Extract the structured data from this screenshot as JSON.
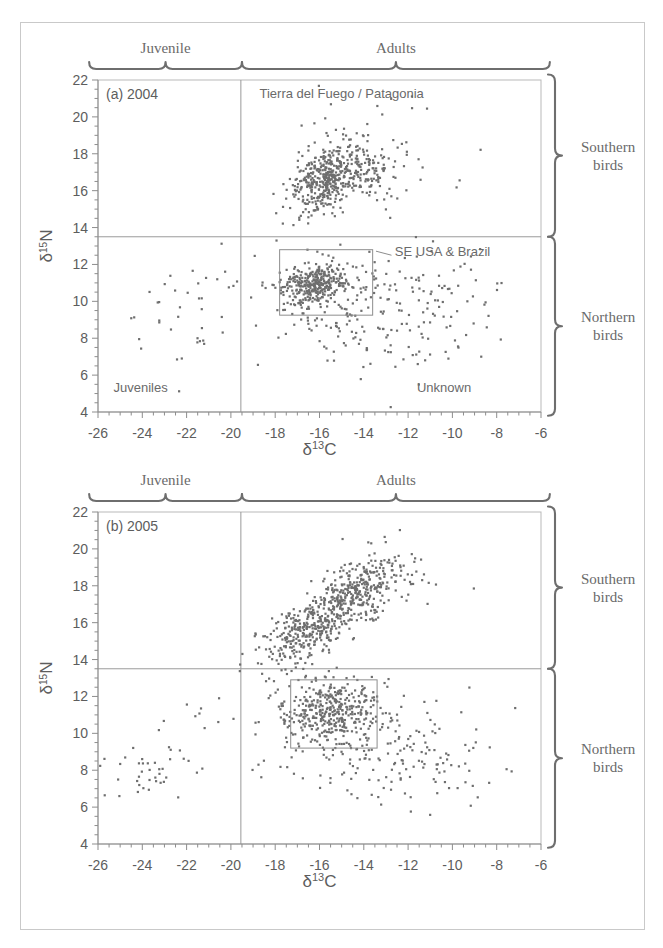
{
  "figure": {
    "outer_border_color": "#c9c9c9",
    "point_color": "#6e6e6e",
    "axis_color": "#8d8d8d"
  },
  "axes": {
    "x": {
      "title_delta": "δ",
      "title_sup": "13",
      "title_elem": "C",
      "ticks": [
        "-26",
        "-24",
        "-22",
        "-20",
        "-18",
        "-16",
        "-14",
        "-12",
        "-10",
        "-8",
        "-6"
      ],
      "tick_values": [
        -26,
        -24,
        -22,
        -20,
        -18,
        -16,
        -14,
        -12,
        -10,
        -8,
        -6
      ],
      "min": -26,
      "max": -6,
      "minor_step": 0.5
    },
    "y": {
      "title_delta": "δ",
      "title_sup": "15",
      "title_elem": "N",
      "ticks": [
        "22",
        "20",
        "18",
        "16",
        "14",
        "12",
        "10",
        "8",
        "6",
        "4"
      ],
      "tick_values": [
        22,
        20,
        18,
        16,
        14,
        12,
        10,
        8,
        6,
        4
      ],
      "min": 4,
      "max": 22,
      "minor_step": 0.5
    }
  },
  "top_braces": [
    {
      "label": "Juvenile",
      "x_from": -26.4,
      "x_to": -19.5
    },
    {
      "label": "Adults",
      "x_from": -19.5,
      "x_to": -5.6
    }
  ],
  "side_braces": [
    {
      "label_line1": "Southern",
      "label_line2": "birds",
      "y_from": 22.3,
      "y_to": 13.5
    },
    {
      "label_line1": "Northern",
      "label_line2": "birds",
      "y_from": 13.5,
      "y_to": 3.8
    }
  ],
  "dividers": {
    "vertical_x": -19.55,
    "horizontal_y": 13.5
  },
  "chart_data": [
    {
      "type": "scatter",
      "panel": "a",
      "title": "(a) 2004",
      "xlabel": "δ13C",
      "ylabel": "δ15N",
      "xlim": [
        -26,
        -6
      ],
      "ylim": [
        4,
        22
      ],
      "grid": false,
      "annotations": [
        {
          "text": "Tierra del Fuego / Patagonia",
          "x": -15.0,
          "y": 21.0,
          "anchor": "middle"
        },
        {
          "text": "SE USA & Brazil",
          "x": -12.6,
          "y": 12.45,
          "anchor": "start"
        },
        {
          "text": "Juveniles",
          "x": -25.3,
          "y": 5.1,
          "anchor": "start"
        },
        {
          "text": "Unknown",
          "x": -11.6,
          "y": 5.1,
          "anchor": "start"
        }
      ],
      "highlight_box": {
        "x0": -17.8,
        "x1": -13.6,
        "y0": 9.25,
        "y1": 12.8
      },
      "leader_line": {
        "x0": -13.45,
        "y0": 12.72,
        "x1": -12.75,
        "y1": 12.5
      },
      "clusters": [
        {
          "name": "southern-adults-main",
          "n": 430,
          "cx": -15.6,
          "cy": 16.7,
          "sx": 0.85,
          "sy": 0.95,
          "rho": 0.45
        },
        {
          "name": "southern-adults-right",
          "n": 70,
          "cx": -13.6,
          "cy": 16.9,
          "sx": 0.7,
          "sy": 0.7,
          "rho": 0.1
        },
        {
          "name": "southern-scatter",
          "n": 70,
          "cx": -14.8,
          "cy": 17.6,
          "sx": 2.0,
          "sy": 1.6,
          "rho": 0.2
        },
        {
          "name": "northern-core",
          "n": 330,
          "cx": -16.2,
          "cy": 10.9,
          "sx": 0.75,
          "sy": 0.55,
          "rho": 0.25
        },
        {
          "name": "northern-spread",
          "n": 150,
          "cx": -14.3,
          "cy": 9.8,
          "sx": 1.9,
          "sy": 1.5,
          "rho": 0.15
        },
        {
          "name": "unknown-right",
          "n": 90,
          "cx": -11.2,
          "cy": 9.2,
          "sx": 2.1,
          "sy": 1.7,
          "rho": 0.05
        },
        {
          "name": "juveniles",
          "n": 38,
          "cx": -21.9,
          "cy": 9.5,
          "sx": 1.3,
          "sy": 1.7,
          "rho": 0.2
        }
      ]
    },
    {
      "type": "scatter",
      "panel": "b",
      "title": "(b) 2005",
      "xlabel": "δ13C",
      "ylabel": "δ15N",
      "xlim": [
        -26,
        -6
      ],
      "ylim": [
        4,
        22
      ],
      "grid": false,
      "annotations": [],
      "highlight_box": {
        "x0": -17.3,
        "x1": -13.4,
        "y0": 9.2,
        "y1": 12.9
      },
      "leader_line": null,
      "clusters": [
        {
          "name": "southern-diagonal",
          "n": 470,
          "cx": -15.4,
          "cy": 16.7,
          "sx": 1.4,
          "sy": 1.35,
          "rho": 0.78
        },
        {
          "name": "southern-upper",
          "n": 120,
          "cx": -13.4,
          "cy": 18.1,
          "sx": 1.2,
          "sy": 1.2,
          "rho": 0.35
        },
        {
          "name": "southern-lower",
          "n": 90,
          "cx": -17.2,
          "cy": 15.1,
          "sx": 0.9,
          "sy": 0.9,
          "rho": 0.4
        },
        {
          "name": "northern-core",
          "n": 360,
          "cx": -15.6,
          "cy": 11.2,
          "sx": 1.05,
          "sy": 0.85,
          "rho": 0.1
        },
        {
          "name": "northern-spread",
          "n": 140,
          "cx": -14.2,
          "cy": 9.4,
          "sx": 2.2,
          "sy": 1.6,
          "rho": 0.1
        },
        {
          "name": "unknown-right",
          "n": 70,
          "cx": -11.0,
          "cy": 8.6,
          "sx": 2.0,
          "sy": 1.6,
          "rho": 0.05
        },
        {
          "name": "juveniles",
          "n": 40,
          "cx": -23.4,
          "cy": 7.9,
          "sx": 1.1,
          "sy": 0.85,
          "rho": 0.25
        },
        {
          "name": "juveniles-upper",
          "n": 8,
          "cx": -21.3,
          "cy": 10.9,
          "sx": 0.9,
          "sy": 0.5,
          "rho": 0.1
        }
      ]
    }
  ]
}
